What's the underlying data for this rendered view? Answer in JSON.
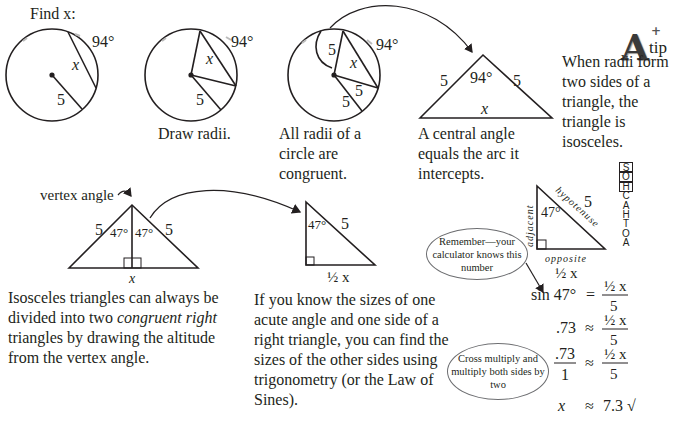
{
  "figure": {
    "step1": {
      "title": "Find x:",
      "arc_label": "94°",
      "chord_label": "x",
      "radius_label": "5"
    },
    "step2": {
      "caption": "Draw radii.",
      "arc_label": "94°",
      "chord_label": "x",
      "radius_label": "5"
    },
    "step3": {
      "caption": "All radii of a circle are congruent.",
      "arc_label": "94°",
      "chord_label": "x",
      "radius_labels": [
        "5",
        "5",
        "5"
      ]
    },
    "step4": {
      "caption": "A central angle equals the arc it intercepts.",
      "angle_label": "94°",
      "side_labels": [
        "5",
        "5"
      ],
      "base_label": "x"
    },
    "tip": {
      "badge_letter": "A",
      "badge_word": "tip",
      "badge_plus": "+",
      "text": "When radii form two sides of a triangle, the triangle is isosceles."
    },
    "isosceles": {
      "vertex_label": "vertex angle",
      "side_labels": [
        "5",
        "5"
      ],
      "angle_labels": [
        "47°",
        "47°"
      ],
      "base_label": "x",
      "caption_parts": [
        "Isosceles triangles can always be divided into two ",
        "congruent right",
        " triangles by drawing the altitude from the vertex angle."
      ]
    },
    "right_triangle": {
      "angle_label": "47°",
      "hyp_label": "5",
      "base_label": "½ x",
      "caption": "If you know the sizes of one acute angle and one side of a right triangle, you can find the sizes of the other sides using trigonometry (or the Law of Sines)."
    },
    "labeled_triangle": {
      "adjacent": "adjacent",
      "hypotenuse": "hypotenuse",
      "opposite": "opposite",
      "angle_label": "47°",
      "hyp_value": "5",
      "base_value": "½ x"
    },
    "mnemonic": {
      "letters": [
        "S",
        "O",
        "H",
        "C",
        "A",
        "H",
        "T",
        "O",
        "A"
      ],
      "boxed_count": 3
    },
    "bubbles": {
      "calculator": "Remember—your calculator knows this number",
      "cross": "Cross multiply and multiply both sides by two"
    },
    "equations": [
      {
        "lhs": "sin 47°",
        "op": "=",
        "num": "½ x",
        "den": "5"
      },
      {
        "lhs": ".73",
        "op": "≈",
        "num": "½ x",
        "den": "5"
      },
      {
        "lhs_num": ".73",
        "lhs_den": "1",
        "op": "≈",
        "num": "½ x",
        "den": "5"
      },
      {
        "lhs": "x",
        "op": "≈",
        "rhs": "7.3 √"
      }
    ]
  }
}
